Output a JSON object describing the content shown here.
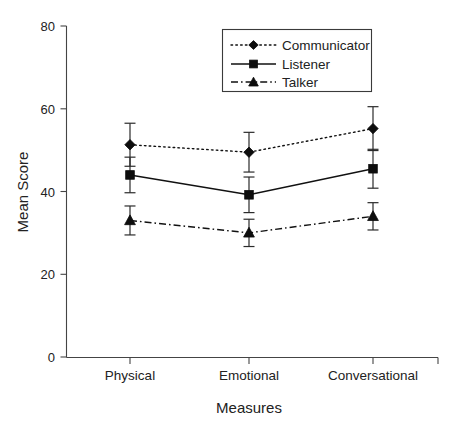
{
  "chart_data": {
    "type": "line",
    "title": "",
    "xlabel": "Measures",
    "ylabel": "Mean Score",
    "categories": [
      "Physical",
      "Emotional",
      "Conversational"
    ],
    "ylim": [
      0,
      80
    ],
    "yticks": [
      0,
      20,
      40,
      60,
      80
    ],
    "ytick_labels": [
      "0",
      "20",
      "40",
      "60",
      "80"
    ],
    "grid": false,
    "legend_position": "top-center",
    "error_bars": "standard deviation / 95% CI whiskers with caps",
    "series": [
      {
        "name": "Communicator",
        "marker": "diamond",
        "line_style": "dotted",
        "values": [
          51.3,
          49.5,
          55.2
        ],
        "errors": [
          5.2,
          4.8,
          5.3
        ]
      },
      {
        "name": "Listener",
        "marker": "square",
        "line_style": "solid",
        "values": [
          44.0,
          39.2,
          45.5
        ],
        "errors": [
          4.3,
          4.3,
          4.7
        ]
      },
      {
        "name": "Talker",
        "marker": "triangle",
        "line_style": "dash-dot",
        "values": [
          33.0,
          30.0,
          34.0
        ],
        "errors": [
          3.5,
          3.3,
          3.3
        ]
      }
    ]
  },
  "axes": {
    "y_title": "Mean Score",
    "x_title": "Measures",
    "y_tick_0": "0",
    "y_tick_1": "20",
    "y_tick_2": "40",
    "y_tick_3": "60",
    "y_tick_4": "80",
    "x_tick_0": "Physical",
    "x_tick_1": "Emotional",
    "x_tick_2": "Conversational"
  },
  "legend": {
    "entries": [
      {
        "label": "Communicator"
      },
      {
        "label": "Listener"
      },
      {
        "label": "Talker"
      }
    ]
  },
  "caption": {
    "text": ""
  },
  "colors": {
    "ink": "#111111",
    "axis": "#444444",
    "background": "#ffffff"
  }
}
